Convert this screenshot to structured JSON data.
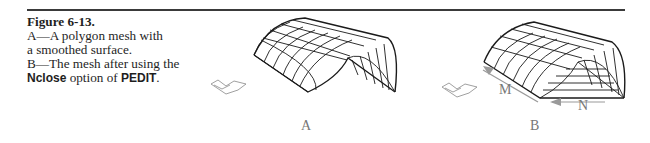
{
  "figure": {
    "number": "Figure 6-13.",
    "caption_lines": [
      "A—A polygon mesh with",
      "a smoothed surface.",
      "B—The mesh after using the"
    ],
    "last_line": {
      "option": "Nclose",
      "middle": " option of ",
      "command": "PEDIT",
      "end": "."
    }
  },
  "panels": [
    {
      "label": "A",
      "description": "Polygon mesh arch with smoothed surface, one open end"
    },
    {
      "label": "B",
      "description": "Mesh after Nclose, closed bottom with horizontal lines",
      "arrows": [
        "M",
        "N"
      ]
    }
  ],
  "colors": {
    "rule": "#3a3a3a",
    "mesh": "#1a1a1a",
    "arrow": "#9a9a9a",
    "ucs": "#888888"
  }
}
